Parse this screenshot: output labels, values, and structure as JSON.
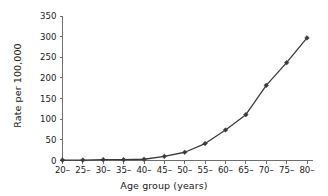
{
  "chart_data": {
    "type": "line",
    "title": "",
    "xlabel": "Age group (years)",
    "ylabel": "Rate per 100,000",
    "categories": [
      "20–",
      "25–",
      "30–",
      "35–",
      "40–",
      "45–",
      "50–",
      "55–",
      "60–",
      "65–",
      "70–",
      "75–",
      "80–"
    ],
    "values": [
      1,
      1,
      2,
      2,
      3,
      10,
      20,
      41,
      74,
      111,
      182,
      237,
      297
    ],
    "ylim": [
      0,
      350
    ],
    "yticks": [
      0,
      50,
      100,
      150,
      200,
      250,
      300,
      350
    ],
    "ytick_labels": [
      "0",
      "50",
      "100",
      "150",
      "200",
      "250",
      "300",
      "350"
    ],
    "grid": false,
    "legend": false,
    "legend_position": "none",
    "marker": "diamond",
    "line_color": "#3a3a3a",
    "marker_color": "#3a3a3a",
    "axis_color": "#6e6e6e",
    "background": "#ffffff"
  }
}
